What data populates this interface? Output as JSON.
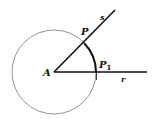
{
  "diagram": {
    "labels": {
      "center": "A",
      "point_on_s": "P",
      "point_on_r": "P",
      "point_on_r_subscript": "1",
      "ray_s": "s",
      "ray_r": "r"
    },
    "colors": {
      "stroke": "#111111",
      "circle": "#777777",
      "background": "#ffffff"
    }
  }
}
